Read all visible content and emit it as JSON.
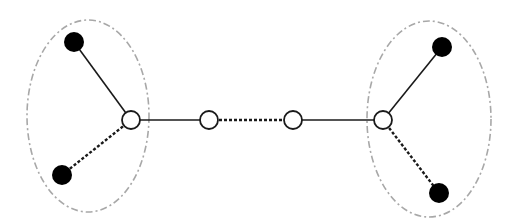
{
  "diagram": {
    "width": 518,
    "height": 224,
    "colors": {
      "background": "#ffffff",
      "edge": "#1a1a1a",
      "filled_node": "#000000",
      "open_node_fill": "#ffffff",
      "open_node_stroke": "#1a1a1a",
      "group_outline": "#a8a8a8"
    },
    "groups": [
      {
        "id": "left-cluster",
        "cx": 88,
        "cy": 116,
        "rx": 61,
        "ry": 96,
        "style": "dash-dot"
      },
      {
        "id": "right-cluster",
        "cx": 429,
        "cy": 119,
        "rx": 62,
        "ry": 98,
        "style": "dash-dot"
      }
    ],
    "nodes": [
      {
        "id": "left-leaf-top",
        "x": 74,
        "y": 42,
        "r": 10,
        "type": "filled"
      },
      {
        "id": "left-leaf-bottom",
        "x": 62,
        "y": 175,
        "r": 10,
        "type": "filled"
      },
      {
        "id": "left-hub",
        "x": 131,
        "y": 120,
        "r": 9,
        "type": "open"
      },
      {
        "id": "middle-left",
        "x": 209,
        "y": 120,
        "r": 9,
        "type": "open"
      },
      {
        "id": "middle-right",
        "x": 293,
        "y": 120,
        "r": 9,
        "type": "open"
      },
      {
        "id": "right-hub",
        "x": 383,
        "y": 120,
        "r": 9,
        "type": "open"
      },
      {
        "id": "right-leaf-top",
        "x": 442,
        "y": 47,
        "r": 10,
        "type": "filled"
      },
      {
        "id": "right-leaf-bottom",
        "x": 439,
        "y": 193,
        "r": 10,
        "type": "filled"
      }
    ],
    "edges": [
      {
        "from": "left-leaf-top",
        "to": "left-hub",
        "style": "solid"
      },
      {
        "from": "left-leaf-bottom",
        "to": "left-hub",
        "style": "dotted"
      },
      {
        "from": "left-hub",
        "to": "middle-left",
        "style": "solid"
      },
      {
        "from": "middle-left",
        "to": "middle-right",
        "style": "dotted"
      },
      {
        "from": "middle-right",
        "to": "right-hub",
        "style": "solid"
      },
      {
        "from": "right-hub",
        "to": "right-leaf-top",
        "style": "solid"
      },
      {
        "from": "right-hub",
        "to": "right-leaf-bottom",
        "style": "dotted"
      }
    ]
  }
}
